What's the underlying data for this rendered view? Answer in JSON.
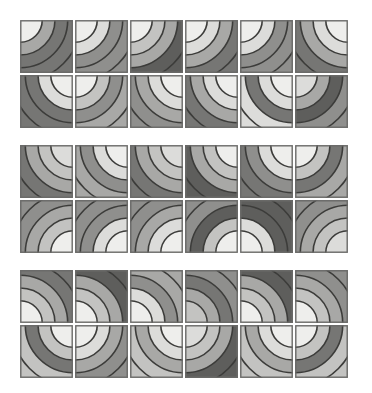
{
  "artwork": {
    "title": "Quarter-Arc Tile Pattern",
    "type": "abstract-geometric-grid",
    "background_color": "#ffffff",
    "canvas": {
      "width": 372,
      "height": 393
    }
  },
  "palette": {
    "near_white": "#eeeeec",
    "light": "#dcdcda",
    "light_mid": "#c3c3c1",
    "mid": "#a8a8a6",
    "mid_dark": "#8f8f8d",
    "dark": "#767674",
    "darker": "#5e5e5c",
    "stroke": "#3c3c3a",
    "tile_border": "#6b6b69"
  },
  "grid": {
    "columns": 6,
    "rows": 6,
    "blocks": 3,
    "rows_per_block": 2,
    "tile_size": 53,
    "tile_gap": 2,
    "block_gap": 15,
    "origin_x": 20,
    "origin_y": 20,
    "stroke_width": 1.6,
    "band_radii": [
      0.42,
      0.66,
      0.9,
      1.16
    ],
    "corners": [
      "tl",
      "tr",
      "br",
      "bl"
    ]
  },
  "tiles": [
    {
      "row": 0,
      "col": 0,
      "corner": "tl",
      "bands": [
        "near_white",
        "mid",
        "dark",
        "dark"
      ]
    },
    {
      "row": 0,
      "col": 1,
      "corner": "tl",
      "bands": [
        "near_white",
        "light",
        "mid_dark",
        "mid_dark"
      ]
    },
    {
      "row": 0,
      "col": 2,
      "corner": "tl",
      "bands": [
        "near_white",
        "light_mid",
        "mid",
        "darker"
      ]
    },
    {
      "row": 0,
      "col": 3,
      "corner": "tl",
      "bands": [
        "near_white",
        "light",
        "mid",
        "dark"
      ]
    },
    {
      "row": 0,
      "col": 4,
      "corner": "tl",
      "bands": [
        "near_white",
        "light",
        "mid_dark",
        "mid_dark"
      ]
    },
    {
      "row": 0,
      "col": 5,
      "corner": "tr",
      "bands": [
        "near_white",
        "light",
        "mid",
        "dark"
      ]
    },
    {
      "row": 1,
      "col": 0,
      "corner": "tr",
      "bands": [
        "near_white",
        "light",
        "dark",
        "dark"
      ]
    },
    {
      "row": 1,
      "col": 1,
      "corner": "tl",
      "bands": [
        "near_white",
        "light_mid",
        "mid_dark",
        "mid"
      ]
    },
    {
      "row": 1,
      "col": 2,
      "corner": "tr",
      "bands": [
        "near_white",
        "light",
        "mid",
        "mid_dark"
      ]
    },
    {
      "row": 1,
      "col": 3,
      "corner": "tr",
      "bands": [
        "near_white",
        "light",
        "mid",
        "dark"
      ]
    },
    {
      "row": 1,
      "col": 4,
      "corner": "tr",
      "bands": [
        "near_white",
        "light",
        "dark",
        "light"
      ]
    },
    {
      "row": 1,
      "col": 5,
      "corner": "tl",
      "bands": [
        "light",
        "mid",
        "darker",
        "mid_dark"
      ]
    },
    {
      "row": 2,
      "col": 0,
      "corner": "tr",
      "bands": [
        "light",
        "light_mid",
        "mid",
        "dark"
      ]
    },
    {
      "row": 2,
      "col": 1,
      "corner": "tr",
      "bands": [
        "near_white",
        "light",
        "mid_dark",
        "mid"
      ]
    },
    {
      "row": 2,
      "col": 2,
      "corner": "tr",
      "bands": [
        "light",
        "light_mid",
        "mid",
        "dark"
      ]
    },
    {
      "row": 2,
      "col": 3,
      "corner": "tr",
      "bands": [
        "near_white",
        "light_mid",
        "mid",
        "darker"
      ]
    },
    {
      "row": 2,
      "col": 4,
      "corner": "tr",
      "bands": [
        "near_white",
        "light",
        "mid_dark",
        "dark"
      ]
    },
    {
      "row": 2,
      "col": 5,
      "corner": "tl",
      "bands": [
        "near_white",
        "light_mid",
        "dark",
        "mid"
      ]
    },
    {
      "row": 3,
      "col": 0,
      "corner": "br",
      "bands": [
        "near_white",
        "light_mid",
        "mid",
        "mid_dark"
      ]
    },
    {
      "row": 3,
      "col": 1,
      "corner": "br",
      "bands": [
        "near_white",
        "light",
        "mid_dark",
        "mid_dark"
      ]
    },
    {
      "row": 3,
      "col": 2,
      "corner": "br",
      "bands": [
        "near_white",
        "light",
        "mid",
        "mid_dark"
      ]
    },
    {
      "row": 3,
      "col": 3,
      "corner": "br",
      "bands": [
        "near_white",
        "light_mid",
        "darker",
        "mid_dark"
      ]
    },
    {
      "row": 3,
      "col": 4,
      "corner": "bl",
      "bands": [
        "near_white",
        "light",
        "darker",
        "darker"
      ]
    },
    {
      "row": 3,
      "col": 5,
      "corner": "br",
      "bands": [
        "light",
        "light_mid",
        "mid",
        "mid_dark"
      ]
    },
    {
      "row": 4,
      "col": 0,
      "corner": "bl",
      "bands": [
        "near_white",
        "light_mid",
        "mid",
        "dark"
      ]
    },
    {
      "row": 4,
      "col": 1,
      "corner": "bl",
      "bands": [
        "near_white",
        "light_mid",
        "mid",
        "darker"
      ]
    },
    {
      "row": 4,
      "col": 2,
      "corner": "bl",
      "bands": [
        "near_white",
        "light",
        "mid_dark",
        "mid"
      ]
    },
    {
      "row": 4,
      "col": 3,
      "corner": "bl",
      "bands": [
        "light_mid",
        "mid",
        "dark",
        "mid_dark"
      ]
    },
    {
      "row": 4,
      "col": 4,
      "corner": "bl",
      "bands": [
        "near_white",
        "light_mid",
        "mid",
        "darker"
      ]
    },
    {
      "row": 4,
      "col": 5,
      "corner": "bl",
      "bands": [
        "near_white",
        "light_mid",
        "mid",
        "mid_dark"
      ]
    },
    {
      "row": 5,
      "col": 0,
      "corner": "tr",
      "bands": [
        "near_white",
        "light_mid",
        "dark",
        "light_mid"
      ]
    },
    {
      "row": 5,
      "col": 1,
      "corner": "tl",
      "bands": [
        "near_white",
        "light",
        "mid",
        "mid_dark"
      ]
    },
    {
      "row": 5,
      "col": 2,
      "corner": "tr",
      "bands": [
        "near_white",
        "light",
        "mid",
        "light_mid"
      ]
    },
    {
      "row": 5,
      "col": 3,
      "corner": "tl",
      "bands": [
        "light",
        "light_mid",
        "mid",
        "darker"
      ]
    },
    {
      "row": 5,
      "col": 4,
      "corner": "tr",
      "bands": [
        "near_white",
        "light",
        "mid",
        "light_mid"
      ]
    },
    {
      "row": 5,
      "col": 5,
      "corner": "tl",
      "bands": [
        "near_white",
        "light_mid",
        "dark",
        "light_mid"
      ]
    }
  ]
}
